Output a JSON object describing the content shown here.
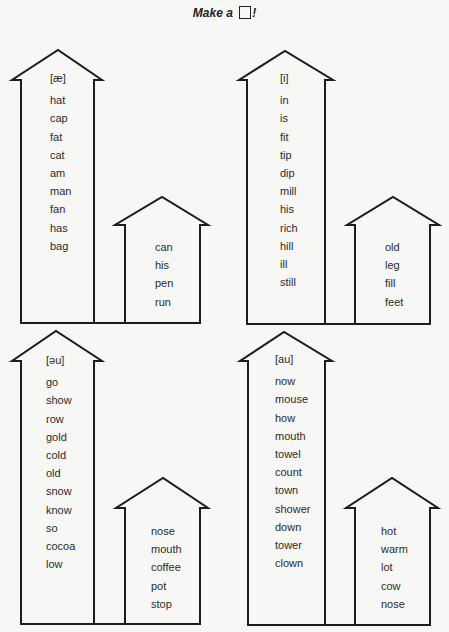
{
  "title": {
    "prefix": "Make a",
    "suffix": "!"
  },
  "houses": [
    {
      "position": "top-left",
      "sound": "[æ]",
      "big_words": [
        "hat",
        "cap",
        "fat",
        "cat",
        "am",
        "man",
        "fan",
        "has",
        "bag"
      ],
      "small_words": [
        "can",
        "his",
        "pen",
        "run"
      ]
    },
    {
      "position": "top-right",
      "sound": "[i]",
      "big_words": [
        "in",
        "is",
        "fit",
        "tip",
        "dip",
        "mill",
        "his",
        "rich",
        "hill",
        "ill",
        "still"
      ],
      "small_words": [
        "old",
        "leg",
        "fill",
        "feet"
      ]
    },
    {
      "position": "bottom-left",
      "sound": "[əu]",
      "big_words": [
        "go",
        "show",
        "row",
        "gold",
        "cold",
        "old",
        "snow",
        "know",
        "so",
        "cocoa",
        "low"
      ],
      "small_words": [
        "nose",
        "mouth",
        "coffee",
        "pot",
        "stop"
      ]
    },
    {
      "position": "bottom-right",
      "sound": "[au]",
      "big_words": [
        "now",
        "mouse",
        "how",
        "mouth",
        "towel",
        "count",
        "town",
        "shower",
        "down",
        "tower",
        "clown"
      ],
      "small_words": [
        "hot",
        "warm",
        "lot",
        "cow",
        "nose"
      ]
    }
  ]
}
